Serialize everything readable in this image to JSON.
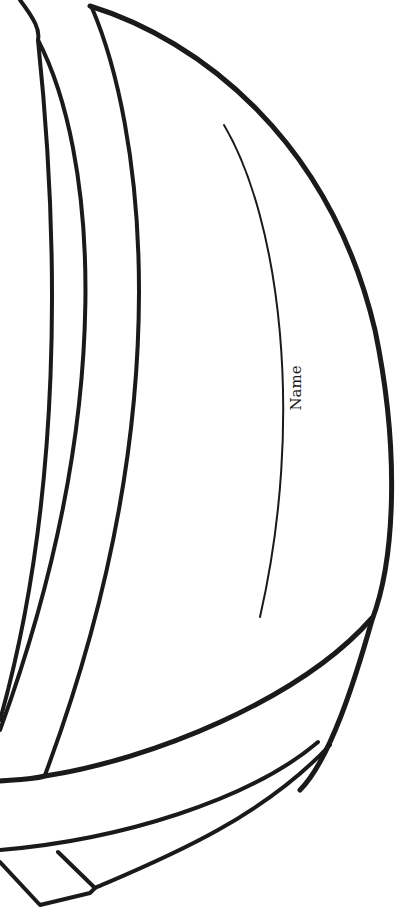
{
  "page": {
    "type": "coloring-template"
  },
  "label": {
    "text": "Name"
  },
  "colors": {
    "background": "#ffffff",
    "stroke": "#1a1a1a"
  }
}
